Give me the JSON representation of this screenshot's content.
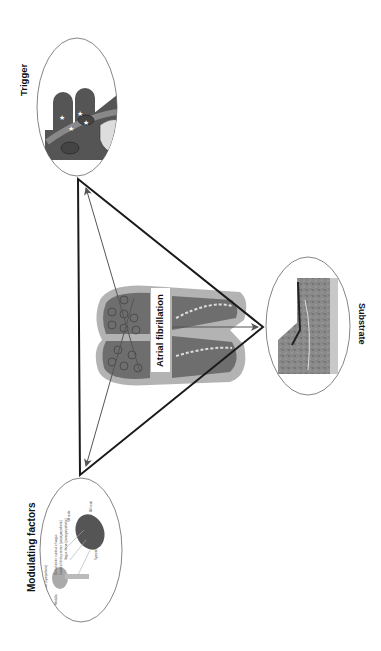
{
  "figure": {
    "title_fragment": "",
    "nodes": {
      "trigger": {
        "label": "Trigger"
      },
      "substrate": {
        "label": "Substrate"
      },
      "modulating": {
        "label": "Modulating factors",
        "annotations": [
          "Dorsal motor nucleus of vagus",
          "Cardioinhibitory center (parasympathetic)",
          "Vagus nerve (parasympathetic)",
          "SA node",
          "AV node",
          "Medulla",
          "Cardioacceleratory center (sympathetic)",
          "Sympathetic cardiac nerve"
        ]
      },
      "center": {
        "label": "Atrial fibrillation"
      }
    },
    "colors": {
      "line": "#1a1a1a",
      "arrow": "#555555",
      "tissue_dark": "#6e6e6e",
      "tissue_light": "#b5b5b5",
      "ellipse_stroke": "#666666"
    }
  }
}
